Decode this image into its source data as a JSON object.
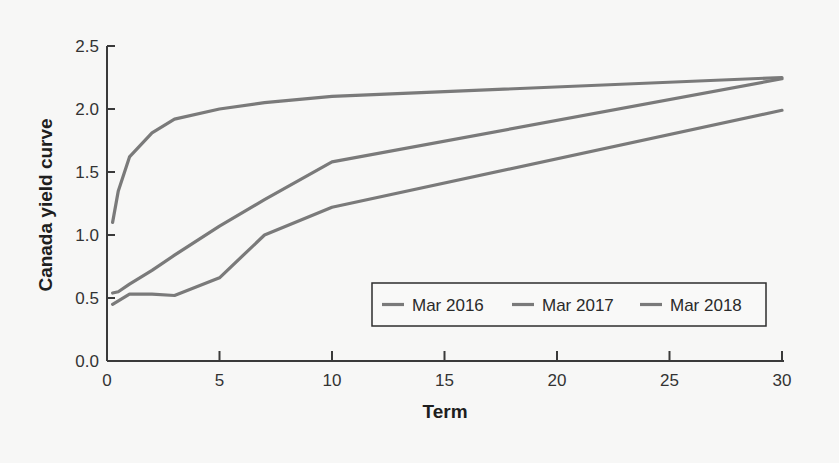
{
  "chart_data": {
    "type": "line",
    "title": "",
    "xlabel": "Term",
    "ylabel": "Canada yield curve",
    "xlim": [
      0,
      30
    ],
    "ylim": [
      0,
      2.5
    ],
    "xticks": [
      0,
      5,
      10,
      15,
      20,
      25,
      30
    ],
    "xtick_labels": [
      "0",
      "5",
      "10",
      "15",
      "20",
      "25",
      "30"
    ],
    "yticks": [
      0,
      0.5,
      1.0,
      1.5,
      2.0,
      2.5
    ],
    "ytick_labels": [
      "0.0",
      "0.5",
      "1.0",
      "1.5",
      "2.0",
      "2.5"
    ],
    "grid": false,
    "legend_position": "lower right (inside)",
    "line_color": "#7a7a7a",
    "series": [
      {
        "name": "Mar 2016",
        "x": [
          0.25,
          1,
          2,
          3,
          5,
          7,
          10,
          30
        ],
        "y": [
          0.45,
          0.53,
          0.53,
          0.52,
          0.66,
          1.0,
          1.22,
          1.99
        ]
      },
      {
        "name": "Mar 2017",
        "x": [
          0.25,
          0.5,
          1,
          2,
          3,
          5,
          7,
          10,
          30
        ],
        "y": [
          0.54,
          0.55,
          0.61,
          0.72,
          0.84,
          1.07,
          1.28,
          1.58,
          2.24
        ]
      },
      {
        "name": "Mar 2018",
        "x": [
          0.25,
          0.5,
          1,
          2,
          3,
          5,
          7,
          10,
          30
        ],
        "y": [
          1.1,
          1.35,
          1.62,
          1.81,
          1.92,
          2.0,
          2.05,
          2.1,
          2.25
        ]
      }
    ]
  }
}
